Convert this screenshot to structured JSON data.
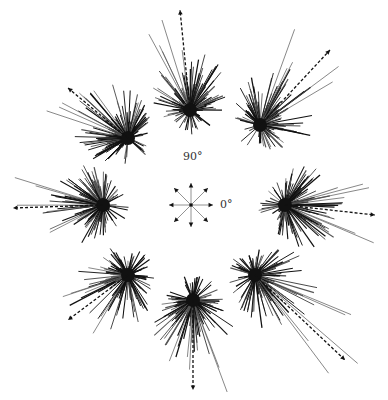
{
  "figure": {
    "key": {
      "label_90": "90°",
      "label_0": "0°",
      "center": [
        191,
        205
      ],
      "arms": 8
    },
    "colors": {
      "ink": "#111111",
      "light_ink": "#555555",
      "background": "#ffffff"
    },
    "bursts": [
      {
        "name": "top",
        "center": [
          190,
          110
        ],
        "mean_arrow": [
          -10,
          -100
        ],
        "spread": 45
      },
      {
        "name": "top-right",
        "center": [
          260,
          125
        ],
        "mean_arrow": [
          70,
          -75
        ],
        "spread": 50
      },
      {
        "name": "right",
        "center": [
          285,
          205
        ],
        "mean_arrow": [
          90,
          10
        ],
        "spread": 45
      },
      {
        "name": "bottom-right",
        "center": [
          255,
          275
        ],
        "mean_arrow": [
          90,
          85
        ],
        "spread": 50
      },
      {
        "name": "bottom",
        "center": [
          193,
          300
        ],
        "mean_arrow": [
          0,
          90
        ],
        "spread": 45
      },
      {
        "name": "bottom-left",
        "center": [
          128,
          275
        ],
        "mean_arrow": [
          -60,
          45
        ],
        "spread": 50
      },
      {
        "name": "left",
        "center": [
          103,
          205
        ],
        "mean_arrow": [
          -90,
          3
        ],
        "spread": 45
      },
      {
        "name": "top-left",
        "center": [
          128,
          138
        ],
        "mean_arrow": [
          -60,
          -50
        ],
        "spread": 45
      }
    ]
  }
}
